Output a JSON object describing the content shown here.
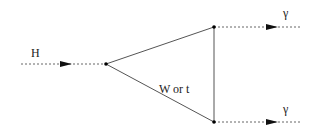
{
  "diagram": {
    "type": "feynman",
    "labels": {
      "incoming": "H",
      "loop": "W or t",
      "outgoing_top": "γ",
      "outgoing_bottom": "γ"
    },
    "vertices": [
      {
        "id": "v1",
        "x": 106,
        "y": 64
      },
      {
        "id": "v2",
        "x": 214,
        "y": 27
      },
      {
        "id": "v3",
        "x": 214,
        "y": 122
      }
    ],
    "edges": [
      {
        "from": "in",
        "to": "v1",
        "style": "dashed-arrow",
        "label": "H"
      },
      {
        "from": "v1",
        "to": "v2",
        "style": "solid"
      },
      {
        "from": "v2",
        "to": "v3",
        "style": "solid"
      },
      {
        "from": "v3",
        "to": "v1",
        "style": "solid",
        "label": "W or t"
      },
      {
        "from": "v2",
        "to": "out1",
        "style": "dashed-arrow",
        "label": "γ"
      },
      {
        "from": "v3",
        "to": "out2",
        "style": "dashed-arrow",
        "label": "γ"
      }
    ],
    "colors": {
      "line": "#555555",
      "dashed": "#666666",
      "vertex": "#000000"
    }
  }
}
